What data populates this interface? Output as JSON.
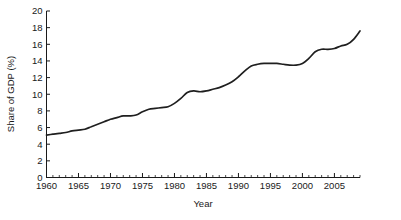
{
  "chart_data": {
    "type": "line",
    "title": "",
    "xlabel": "Year",
    "ylabel": "Share of GDP (%)",
    "xlim": [
      1960,
      2009
    ],
    "ylim": [
      0,
      20
    ],
    "grid": false,
    "legend": null,
    "y_ticks": [
      0,
      2,
      4,
      6,
      8,
      10,
      12,
      14,
      16,
      18,
      20
    ],
    "y_tick_labels": [
      "0",
      "2",
      "4",
      "6",
      "8",
      "10",
      "12",
      "14",
      "16",
      "18",
      "20"
    ],
    "x_ticks": [
      1960,
      1965,
      1970,
      1975,
      1980,
      1985,
      1990,
      1995,
      2000,
      2005
    ],
    "x_tick_labels": [
      "1960",
      "1965",
      "1970",
      "1975",
      "1980",
      "1985",
      "1990",
      "1995",
      "2000",
      "2005"
    ],
    "x_minor_tick_step": 1,
    "line_color": "#1f1f1f",
    "series": [
      {
        "name": "Share of GDP (%)",
        "x": [
          1960,
          1961,
          1962,
          1963,
          1964,
          1965,
          1966,
          1967,
          1968,
          1969,
          1970,
          1971,
          1972,
          1973,
          1974,
          1975,
          1976,
          1977,
          1978,
          1979,
          1980,
          1981,
          1982,
          1983,
          1984,
          1985,
          1986,
          1987,
          1988,
          1989,
          1990,
          1991,
          1992,
          1993,
          1994,
          1995,
          1996,
          1997,
          1998,
          1999,
          2000,
          2001,
          2002,
          2003,
          2004,
          2005,
          2006,
          2007,
          2008,
          2009
        ],
        "values": [
          5.1,
          5.2,
          5.3,
          5.4,
          5.6,
          5.7,
          5.8,
          6.1,
          6.4,
          6.7,
          7.0,
          7.2,
          7.4,
          7.4,
          7.5,
          7.9,
          8.2,
          8.3,
          8.4,
          8.5,
          8.9,
          9.5,
          10.2,
          10.4,
          10.3,
          10.4,
          10.6,
          10.8,
          11.1,
          11.5,
          12.1,
          12.8,
          13.4,
          13.6,
          13.7,
          13.7,
          13.7,
          13.6,
          13.5,
          13.5,
          13.7,
          14.3,
          15.1,
          15.4,
          15.4,
          15.5,
          15.8,
          16.0,
          16.6,
          17.6
        ]
      }
    ]
  },
  "axes": {
    "ylabel": "Share of GDP (%)",
    "xlabel": "Year"
  }
}
